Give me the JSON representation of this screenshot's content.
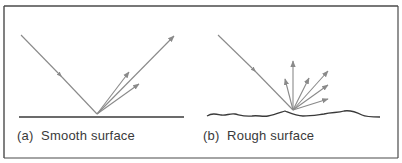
{
  "diagram": {
    "panels": [
      {
        "id": "a",
        "caption": "(a)  Smooth surface",
        "surface": "smooth",
        "incident_ray": "single ray striking flat surface at ~45°",
        "reflected_rays": 3
      },
      {
        "id": "b",
        "caption": "(b)  Rough surface",
        "surface": "rough",
        "incident_ray": "single ray striking irregular surface",
        "reflected_rays": 6
      }
    ],
    "colors": {
      "ray": "#8a8a8a",
      "surface": "#3a3a3a",
      "border": "#4a4a4a",
      "text": "#3a3a3a"
    }
  }
}
